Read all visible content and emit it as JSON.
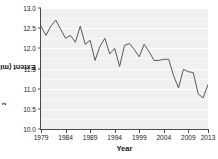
{
  "chart_data": {
    "type": "line",
    "title": "",
    "xlabel": "Year",
    "ylabel": "Extent (millions of km²)",
    "ylabel_base": "Extent (millions of km",
    "ylabel_sup": "2",
    "ylabel_tail": ")",
    "xlim": [
      1979,
      2013
    ],
    "ylim": [
      10.0,
      13.0
    ],
    "grid": true,
    "legend": "none",
    "line_color": "#595959",
    "panel_color": "#f0f0f0",
    "gridline_color": "#ffffff",
    "axis_color": "#4d4d4d",
    "x_ticks": [
      1979,
      1984,
      1989,
      1994,
      1999,
      2004,
      2009,
      2013
    ],
    "x_tick_labels": [
      "1979",
      "1984",
      "1989",
      "1994",
      "1999",
      "2004",
      "2009",
      "2013"
    ],
    "y_ticks": [
      10.0,
      10.5,
      11.0,
      11.5,
      12.0,
      12.5,
      13.0
    ],
    "y_tick_labels": [
      "10.0",
      "10.5",
      "11.0",
      "11.5",
      "12.0",
      "12.5",
      "13.0"
    ],
    "x": [
      1979,
      1980,
      1981,
      1982,
      1983,
      1984,
      1985,
      1986,
      1987,
      1988,
      1989,
      1990,
      1991,
      1992,
      1993,
      1994,
      1995,
      1996,
      1997,
      1998,
      1999,
      2000,
      2001,
      2002,
      2003,
      2004,
      2005,
      2006,
      2007,
      2008,
      2009,
      2010,
      2011,
      2012,
      2013
    ],
    "values": [
      12.55,
      12.32,
      12.55,
      12.7,
      12.47,
      12.25,
      12.32,
      12.15,
      12.55,
      12.1,
      12.2,
      11.7,
      12.05,
      12.25,
      11.86,
      12.0,
      11.55,
      12.07,
      12.12,
      11.97,
      11.79,
      12.1,
      11.92,
      11.7,
      11.7,
      11.73,
      11.73,
      11.32,
      11.02,
      11.48,
      11.42,
      11.4,
      10.87,
      10.77,
      11.1
    ]
  }
}
